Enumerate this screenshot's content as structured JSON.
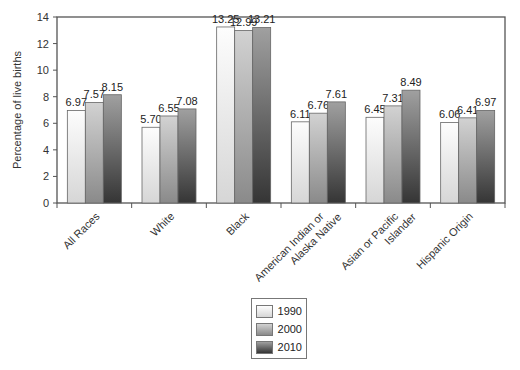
{
  "chart_data": {
    "type": "bar",
    "title": "",
    "xlabel": "",
    "ylabel": "Percentage of live births",
    "ylim": [
      0,
      14
    ],
    "yticks": [
      0,
      2,
      4,
      6,
      8,
      10,
      12,
      14
    ],
    "grid": false,
    "legend_position": "bottom-center",
    "categories": [
      "All Races",
      "White",
      "Black",
      "American Indian or Alaska Native",
      "Asian or Pacific Islander",
      "Hispanic Origin"
    ],
    "category_lines": [
      [
        "All Races"
      ],
      [
        "White"
      ],
      [
        "Black"
      ],
      [
        "American Indian or",
        "Alaska Native"
      ],
      [
        "Asian or Pacific",
        "Islander"
      ],
      [
        "Hispanic Origin"
      ]
    ],
    "series": [
      {
        "name": "1990",
        "values": [
          6.97,
          5.7,
          13.25,
          6.11,
          6.45,
          6.06
        ],
        "labels": [
          "6.97",
          "5.70",
          "13.25",
          "6.11",
          "6.45",
          "6.06"
        ]
      },
      {
        "name": "2000",
        "values": [
          7.57,
          6.55,
          12.99,
          6.76,
          7.31,
          6.41
        ],
        "labels": [
          "7.57",
          "6.55",
          "12.99",
          "6.76",
          "7.31",
          "6.41"
        ]
      },
      {
        "name": "2010",
        "values": [
          8.15,
          7.08,
          13.21,
          7.61,
          8.49,
          6.97
        ],
        "labels": [
          "8.15",
          "7.08",
          "13.21",
          "7.61",
          "8.49",
          "6.97"
        ]
      }
    ]
  },
  "colors": {
    "1990": [
      "#fbfbfb",
      "#d8d8d8"
    ],
    "2000": [
      "#d0d0d0",
      "#8e8e8e"
    ],
    "2010": [
      "#9a9a9a",
      "#3a3a3a"
    ],
    "frame": "#555555"
  }
}
